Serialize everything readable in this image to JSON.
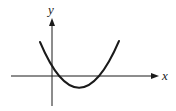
{
  "diagram": {
    "type": "function-graph",
    "axes": {
      "x_label": "x",
      "y_label": "y"
    },
    "colors": {
      "stroke": "#1a1a1a",
      "background": "#ffffff"
    },
    "curve": {
      "shape": "parabola",
      "opens": "up",
      "vertex_region": "fourth quadrant (x>0, y<0)",
      "x_intercepts": 2,
      "y_intercept": "positive"
    }
  }
}
